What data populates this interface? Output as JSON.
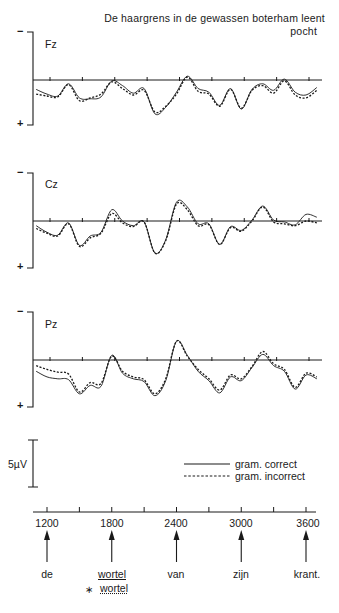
{
  "title": {
    "line1": "De haargrens in de gewassen boterham leent",
    "line2": "pocht"
  },
  "channels": [
    {
      "name": "Fz",
      "baseline_y": 80,
      "top_y": 32,
      "bottom_y": 125
    },
    {
      "name": "Cz",
      "baseline_y": 221,
      "top_y": 173,
      "bottom_y": 268
    },
    {
      "name": "Pz",
      "baseline_y": 360,
      "top_y": 312,
      "bottom_y": 407
    }
  ],
  "polarity": {
    "negative": "−",
    "positive": "+"
  },
  "scale_bar": {
    "label": "5µV",
    "value_uv": 5
  },
  "legend": [
    {
      "label": "gram. correct",
      "style": "solid"
    },
    {
      "label": "gram. incorrect",
      "style": "dashed"
    }
  ],
  "time_axis": {
    "tick_labels": [
      "1200",
      "1800",
      "2400",
      "3000",
      "3600"
    ],
    "unit": "ms"
  },
  "words": [
    {
      "text": "de",
      "at": "1200"
    },
    {
      "text": "wortel",
      "at": "1800",
      "style": "underline"
    },
    {
      "text": "van",
      "at": "2400"
    },
    {
      "text": "zijn",
      "at": "3000"
    },
    {
      "text": "krant.",
      "at": "3600"
    }
  ],
  "incorrect_word": {
    "marker": "∗",
    "text": "wortel"
  },
  "chart_data": {
    "type": "line",
    "xlabel": "time (ms)",
    "ylabel": "amplitude (µV), negative up",
    "x": [
      1100,
      1200,
      1300,
      1400,
      1500,
      1600,
      1700,
      1800,
      1900,
      2000,
      2100,
      2200,
      2300,
      2400,
      2500,
      2600,
      2700,
      2800,
      2900,
      3000,
      3100,
      3200,
      3300,
      3400,
      3500,
      3600,
      3700
    ],
    "xlim": [
      1070,
      3750
    ],
    "xticks": [
      1200,
      1500,
      1800,
      2100,
      2400,
      2700,
      3000,
      3300,
      3600
    ],
    "scale_bar_uv": 5,
    "legend_position": "lower right",
    "grid": false,
    "panels": [
      {
        "channel": "Fz",
        "series": [
          {
            "name": "gram. correct",
            "values": [
              1.0,
              1.5,
              1.7,
              0.4,
              1.9,
              2.0,
              1.8,
              0.1,
              0.6,
              1.4,
              0.9,
              3.6,
              2.9,
              1.3,
              -0.4,
              0.9,
              1.3,
              2.7,
              0.9,
              3.1,
              1.0,
              0.4,
              1.1,
              -0.1,
              1.3,
              1.6,
              0.8
            ]
          },
          {
            "name": "gram. incorrect",
            "values": [
              1.5,
              1.7,
              1.8,
              0.5,
              2.2,
              1.9,
              1.5,
              0.2,
              0.9,
              1.6,
              1.1,
              3.4,
              2.8,
              1.5,
              -0.3,
              1.2,
              1.5,
              2.8,
              1.0,
              3.0,
              1.1,
              0.6,
              1.4,
              0.1,
              1.6,
              1.9,
              1.1
            ]
          }
        ]
      },
      {
        "channel": "Cz",
        "series": [
          {
            "name": "gram. correct",
            "values": [
              0.5,
              1.2,
              1.5,
              0.2,
              2.6,
              1.6,
              1.2,
              -1.2,
              0.0,
              0.5,
              0.1,
              3.4,
              2.0,
              -2.0,
              -1.5,
              0.3,
              0.3,
              2.5,
              0.6,
              1.0,
              -0.1,
              -1.6,
              -0.1,
              0.1,
              0.4,
              -0.7,
              -0.4
            ]
          },
          {
            "name": "gram. incorrect",
            "values": [
              0.8,
              1.3,
              1.6,
              0.3,
              2.7,
              1.8,
              1.3,
              -0.8,
              0.2,
              0.6,
              0.1,
              3.4,
              2.1,
              -1.8,
              -1.2,
              0.5,
              0.4,
              2.5,
              0.7,
              1.1,
              0.0,
              -1.5,
              0.1,
              0.3,
              0.5,
              0.0,
              0.2
            ]
          }
        ]
      },
      {
        "channel": "Pz",
        "series": [
          {
            "name": "gram. correct",
            "values": [
              1.2,
              1.8,
              2.0,
              2.1,
              3.6,
              2.7,
              2.8,
              -0.5,
              1.4,
              2.0,
              2.3,
              3.8,
              2.2,
              -2.0,
              -0.5,
              1.2,
              2.2,
              3.5,
              1.8,
              2.2,
              0.8,
              -0.6,
              0.6,
              1.2,
              3.1,
              1.6,
              2.0
            ]
          },
          {
            "name": "gram. incorrect",
            "values": [
              0.6,
              1.0,
              1.3,
              1.5,
              3.4,
              2.4,
              2.5,
              -0.4,
              1.2,
              1.8,
              2.1,
              3.6,
              2.0,
              -2.0,
              -0.4,
              1.0,
              2.0,
              3.2,
              1.6,
              2.0,
              0.7,
              -0.9,
              0.4,
              1.0,
              2.9,
              1.4,
              1.8
            ]
          }
        ]
      }
    ]
  }
}
